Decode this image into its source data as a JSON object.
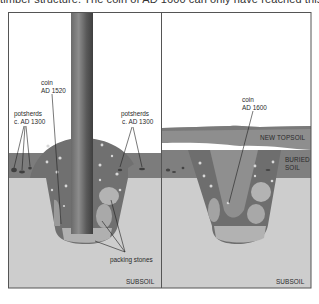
{
  "caption_fragment": "timber structure. The coin of AD 1600 can only have reached this",
  "colors": {
    "frame": "#555555",
    "background": "#ffffff",
    "subsoil": "#cdcdcd",
    "topsoil": "#7c7c7c",
    "new_topsoil": "#8e8e8e",
    "buried_soil": "#7f7f7f",
    "pit_fill": "#737373",
    "packing_stone": "#b3b3b3",
    "post_dark": "#4f4f4f",
    "post_light": "#8a8a8a"
  },
  "left_panel": {
    "labels": {
      "coin": "coin",
      "coin_date": "AD 1520",
      "potsherds_left": "potsherds",
      "potsherds_left_date": "c. AD 1300",
      "potsherds_right": "potsherds",
      "potsherds_right_date": "c. AD 1300",
      "packing_stones": "packing stones",
      "subsoil": "SUBSOIL"
    }
  },
  "right_panel": {
    "labels": {
      "coin": "coin",
      "coin_date": "AD 1600",
      "new_topsoil": "NEW TOPSOIL",
      "buried_soil_1": "BURIED",
      "buried_soil_2": "SOIL",
      "subsoil": "SUBSOIL"
    }
  }
}
